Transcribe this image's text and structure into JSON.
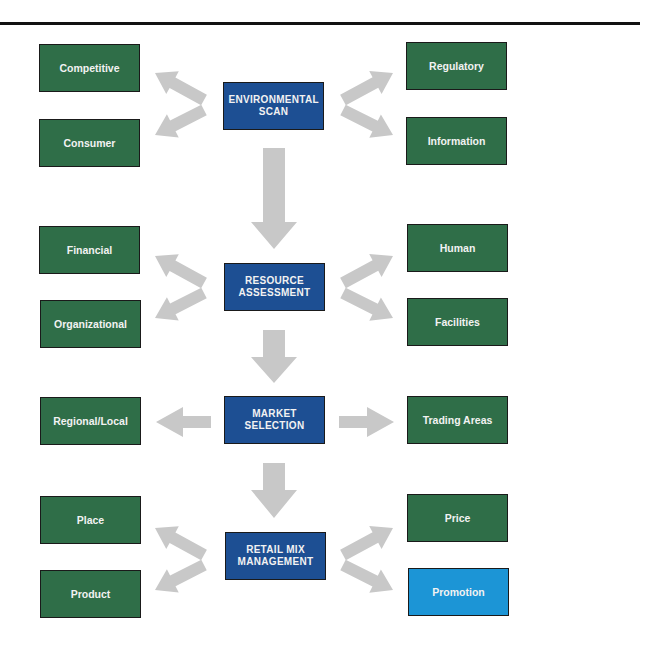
{
  "diagram": {
    "colors": {
      "factor_box": "#2f6e48",
      "stage_box": "#1d4f93",
      "highlight_box": "#1c95d6",
      "arrow": "#c8c8c8",
      "rule": "#111111"
    },
    "stages": [
      {
        "label": "ENVIRONMENTAL SCAN",
        "left": [
          "Competitive",
          "Consumer"
        ],
        "right": [
          "Regulatory",
          "Information"
        ]
      },
      {
        "label": "RESOURCE ASSESSMENT",
        "left": [
          "Financial",
          "Organizational"
        ],
        "right": [
          "Human",
          "Facilities"
        ]
      },
      {
        "label": "MARKET SELECTION",
        "left": [
          "Regional/Local"
        ],
        "right": [
          "Trading Areas"
        ]
      },
      {
        "label": "RETAIL MIX MANAGEMENT",
        "left": [
          "Place",
          "Product"
        ],
        "right": [
          "Price",
          "Promotion"
        ]
      }
    ],
    "highlighted": "Promotion"
  }
}
